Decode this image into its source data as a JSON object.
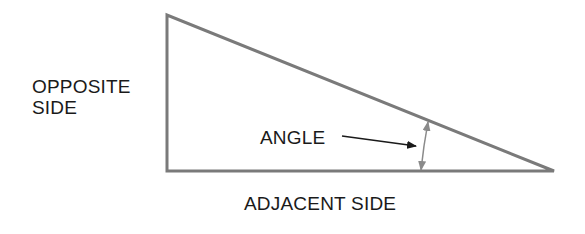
{
  "diagram": {
    "type": "right-triangle",
    "labels": {
      "opposite_line1": "OPPOSITE",
      "opposite_line2": "SIDE",
      "angle": "ANGLE",
      "adjacent": "ADJACENT SIDE"
    },
    "colors": {
      "triangle_stroke": "#7a7a7a",
      "pointer_arrow": "#1a1a1a",
      "angle_arrow": "#8a8a8a",
      "text": "#1a1a1a"
    },
    "vertices": {
      "top_left": [
        167,
        15
      ],
      "bottom_left": [
        167,
        171
      ],
      "right": [
        554,
        171
      ]
    }
  }
}
